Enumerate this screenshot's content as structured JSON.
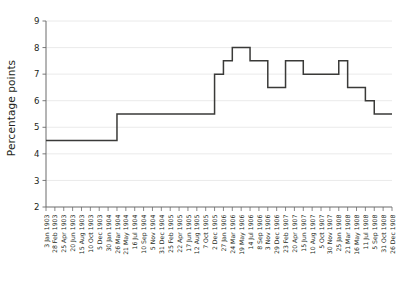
{
  "chart_data": {
    "type": "line",
    "title": "",
    "subtitle": "",
    "xlabel": "",
    "ylabel": "Percentage points",
    "ylim": [
      2,
      9
    ],
    "ytick_labels": [
      "2",
      "3",
      "4",
      "5",
      "6",
      "7",
      "8",
      "9"
    ],
    "ytick_values": [
      2,
      3,
      4,
      5,
      6,
      7,
      8,
      9
    ],
    "grid": true,
    "legend": "none",
    "line_color": "#3a3a38",
    "grid_color": "#e8e8e8",
    "axis_color": "#6b6b6b",
    "background_color": "#ffffff",
    "step_style": "post",
    "categories": [
      "3 Jan 1903",
      "28 Feb 1903",
      "25 Apr 1903",
      "20 Jun 1903",
      "15 Aug 1903",
      "10 Oct 1903",
      "5 Dec 1903",
      "30 Jan 1904",
      "26 Mar 1904",
      "21 May 1904",
      "16 Jul 1904",
      "10 Sep 1904",
      "5 Nov 1904",
      "31 Dec 1904",
      "25 Feb 1905",
      "22 Apr 1905",
      "17 Jun 1905",
      "12 Aug 1905",
      "7 Oct 1905",
      "2 Dec 1905",
      "27 Jan 1906",
      "24 Mar 1906",
      "19 May 1906",
      "14 Jul 1906",
      "8 Sep 1906",
      "3 Nov 1906",
      "29 Dec 1906",
      "23 Feb 1907",
      "20 Apr 1907",
      "15 Jun 1907",
      "10 Aug 1907",
      "5 Oct 1907",
      "30 Nov 1907",
      "25 Jan 1908",
      "21 Mar 1908",
      "16 May 1908",
      "11 Jul 1908",
      "5 Sep 1908",
      "31 Oct 1908",
      "26 Dec 1908"
    ],
    "values": [
      4.5,
      4.5,
      4.5,
      4.5,
      4.5,
      4.5,
      4.5,
      4.5,
      5.5,
      5.5,
      5.5,
      5.5,
      5.5,
      5.5,
      5.5,
      5.5,
      5.5,
      5.5,
      5.5,
      7.0,
      7.5,
      8.0,
      8.0,
      7.5,
      7.5,
      6.5,
      6.5,
      7.5,
      7.5,
      7.0,
      7.0,
      7.0,
      7.0,
      7.5,
      6.5,
      6.5,
      6.0,
      5.5,
      5.5,
      5.5
    ],
    "series": [
      {
        "name": "Percentage points",
        "values": [
          4.5,
          4.5,
          4.5,
          4.5,
          4.5,
          4.5,
          4.5,
          4.5,
          5.5,
          5.5,
          5.5,
          5.5,
          5.5,
          5.5,
          5.5,
          5.5,
          5.5,
          5.5,
          5.5,
          7.0,
          7.5,
          8.0,
          8.0,
          7.5,
          7.5,
          6.5,
          6.5,
          7.5,
          7.5,
          7.0,
          7.0,
          7.0,
          7.0,
          7.5,
          6.5,
          6.5,
          6.0,
          5.5,
          5.5,
          5.5
        ]
      }
    ]
  }
}
